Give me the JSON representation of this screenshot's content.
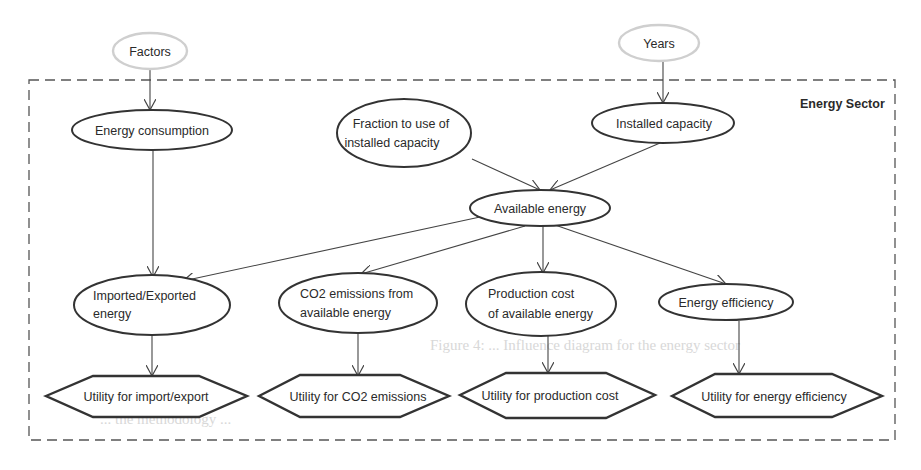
{
  "diagram": {
    "type": "influence-diagram",
    "container": {
      "label": "Energy Sector"
    },
    "external_nodes": [
      {
        "id": "factors",
        "label": "Factors",
        "shape": "ellipse"
      },
      {
        "id": "years",
        "label": "Years",
        "shape": "ellipse"
      }
    ],
    "chance_nodes": [
      {
        "id": "energy_consumption",
        "lines": [
          "Energy consumption"
        ]
      },
      {
        "id": "fraction",
        "lines": [
          "Fraction to use of",
          "installed capacity"
        ]
      },
      {
        "id": "installed_capacity",
        "lines": [
          "Installed capacity"
        ]
      },
      {
        "id": "available_energy",
        "lines": [
          "Available energy"
        ]
      },
      {
        "id": "imported_exported",
        "lines": [
          "Imported/Exported",
          "energy"
        ]
      },
      {
        "id": "co2_emissions",
        "lines": [
          "CO2 emissions from",
          "available energy"
        ]
      },
      {
        "id": "production_cost",
        "lines": [
          "Production cost",
          "of available energy"
        ]
      },
      {
        "id": "energy_efficiency",
        "lines": [
          "Energy efficiency"
        ]
      }
    ],
    "utility_nodes": [
      {
        "id": "u_import_export",
        "label": "Utility for import/export"
      },
      {
        "id": "u_co2",
        "label": "Utility for CO2 emissions"
      },
      {
        "id": "u_production",
        "label": "Utility for production cost"
      },
      {
        "id": "u_efficiency",
        "label": "Utility for energy efficiency"
      }
    ],
    "edges": [
      [
        "factors",
        "energy_consumption"
      ],
      [
        "years",
        "installed_capacity"
      ],
      [
        "fraction",
        "available_energy"
      ],
      [
        "installed_capacity",
        "available_energy"
      ],
      [
        "energy_consumption",
        "imported_exported"
      ],
      [
        "available_energy",
        "imported_exported"
      ],
      [
        "available_energy",
        "co2_emissions"
      ],
      [
        "available_energy",
        "production_cost"
      ],
      [
        "available_energy",
        "energy_efficiency"
      ],
      [
        "imported_exported",
        "u_import_export"
      ],
      [
        "co2_emissions",
        "u_co2"
      ],
      [
        "production_cost",
        "u_production"
      ],
      [
        "energy_efficiency",
        "u_efficiency"
      ]
    ]
  },
  "background_bleed": {
    "line1": "Figure 4: ... Influence diagram for the energy sector",
    "line2": "... the methodology ..."
  }
}
